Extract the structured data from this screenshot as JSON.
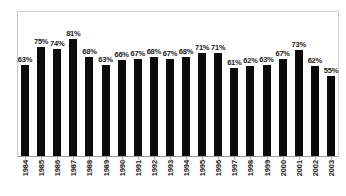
{
  "chart_data": {
    "type": "bar",
    "title": "",
    "subtitle": "",
    "xlabel": "",
    "ylabel": "",
    "ylim": [
      0,
      100
    ],
    "grid": false,
    "legend": null,
    "value_suffix": "%",
    "bar_color": "#0b0b0b",
    "categories": [
      "1984",
      "1985",
      "1986",
      "1987",
      "1988",
      "1989",
      "1990",
      "1991",
      "1992",
      "1993",
      "1994",
      "1995",
      "1996",
      "1997",
      "1998",
      "1999",
      "2000",
      "2001",
      "2002",
      "2003"
    ],
    "values": [
      63,
      75,
      74,
      81,
      68,
      63,
      66,
      67,
      68,
      67,
      68,
      71,
      71,
      61,
      62,
      63,
      67,
      73,
      62,
      55
    ],
    "data_labels": [
      "63%",
      "75%",
      "74%",
      "81%",
      "68%",
      "63%",
      "66%",
      "67%",
      "68%",
      "67%",
      "68%",
      "71%",
      "71%",
      "61%",
      "62%",
      "63%",
      "67%",
      "73%",
      "62%",
      "55%"
    ]
  },
  "frame": {
    "border_color": "#d2d2d2",
    "axis_color": "#9a9a9a",
    "background": "#ffffff"
  }
}
